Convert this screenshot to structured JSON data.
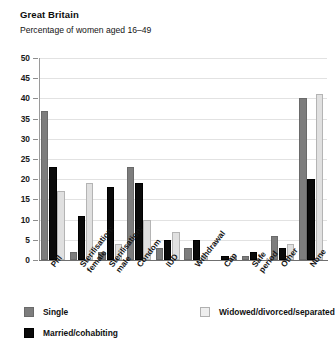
{
  "chart_data": {
    "type": "bar",
    "title": "Great Britain",
    "subtitle": "Percentage  of women aged 16–49",
    "xlabel": "",
    "ylabel": "",
    "ylim": [
      0,
      50
    ],
    "yticks": [
      0,
      5,
      10,
      15,
      20,
      25,
      30,
      35,
      40,
      45,
      50
    ],
    "grid": true,
    "legend_position": "bottom-left",
    "categories": [
      "Pill",
      "Sterilisation:\nfemale",
      "Sterilisation:\nmale",
      "Condom",
      "IUD",
      "Withdrawal",
      "Cap",
      "Safe\nperiod",
      "Other",
      "None"
    ],
    "series": [
      {
        "name": "Single",
        "color": "#7d7d7d",
        "values": [
          37,
          2,
          2,
          23,
          3,
          3,
          0,
          1,
          6,
          40
        ]
      },
      {
        "name": "Married/cohabiting",
        "color": "#0a0a0a",
        "values": [
          23,
          11,
          18,
          19,
          5,
          5,
          1,
          2,
          3,
          20
        ]
      },
      {
        "name": "Widowed/divorced/separated",
        "color": "#e0e0e0",
        "values": [
          17,
          19,
          4,
          10,
          7,
          1,
          1,
          0,
          4,
          41
        ]
      }
    ]
  },
  "legend": {
    "single_label": "Single",
    "widowed_label": "Widowed/divorced/separated",
    "married_label": "Married/cohabiting"
  }
}
